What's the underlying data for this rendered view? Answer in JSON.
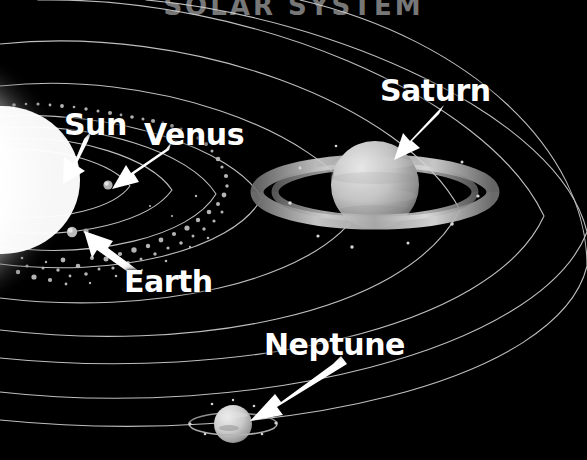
{
  "image": {
    "kind": "astronomy-illustration",
    "subject": "Solar System",
    "width": 587,
    "height": 460,
    "background_color": "#000000",
    "orbit_line_color": "#cfcfcf",
    "label_color": "#ffffff",
    "arrow_color": "#ffffff"
  },
  "title": {
    "text": "SOLAR SYSTEM",
    "note": "cropped at top edge"
  },
  "labels": [
    {
      "id": "sun",
      "text": "Sun"
    },
    {
      "id": "venus",
      "text": "Venus"
    },
    {
      "id": "earth",
      "text": "Earth"
    },
    {
      "id": "saturn",
      "text": "Saturn"
    },
    {
      "id": "neptune",
      "text": "Neptune"
    }
  ],
  "bodies": [
    {
      "name": "Sun",
      "type": "star",
      "color": "#ffffff",
      "glow_color": "#f2f2f2",
      "center": [
        10,
        180
      ],
      "radius": 74
    },
    {
      "name": "Venus",
      "type": "planet",
      "color": "#a9a9a9",
      "center": [
        108,
        185
      ],
      "radius": 4.5
    },
    {
      "name": "Earth",
      "type": "planet",
      "color": "#b4b4b4",
      "center": [
        72,
        232
      ],
      "radius": 5
    },
    {
      "name": "Moon",
      "type": "moon",
      "color": "#9a9a9a",
      "center": [
        85,
        231
      ],
      "radius": 2.5
    },
    {
      "name": "Saturn",
      "type": "planet",
      "color": "#bdbdbd",
      "center": [
        375,
        185
      ],
      "radius": 44,
      "has_rings": true,
      "ring_color": "#9e9e9e"
    },
    {
      "name": "Neptune",
      "type": "planet",
      "color": "#c6c6c6",
      "center": [
        233,
        424
      ],
      "radius": 19,
      "has_rings": true,
      "ring_color": "#8f8f8f"
    }
  ],
  "asteroid_belt": {
    "name": "Asteroid Belt",
    "color": "#b0b0b0",
    "description": "scattered small rocks between the inner planets and outer orbits"
  },
  "orbits": {
    "count": 9,
    "color": "#cfcfcf",
    "stroke_width": 1.1,
    "description": "concentric elliptical orbit arcs centred near the Sun at the left edge"
  },
  "arrows": [
    {
      "id": "arrow-sun",
      "points_to": "Sun",
      "from": [
        90,
        133
      ],
      "to": [
        40,
        178
      ]
    },
    {
      "id": "arrow-venus",
      "points_to": "Venus",
      "from": [
        168,
        145
      ],
      "to": [
        114,
        188
      ]
    },
    {
      "id": "arrow-earth",
      "points_to": "Earth",
      "from": [
        128,
        272
      ],
      "to": [
        79,
        234
      ]
    },
    {
      "id": "arrow-saturn",
      "points_to": "Saturn",
      "from": [
        441,
        108
      ],
      "to": [
        395,
        155
      ]
    },
    {
      "id": "arrow-neptune",
      "points_to": "Neptune",
      "from": [
        338,
        360
      ],
      "to": [
        252,
        420
      ]
    }
  ]
}
